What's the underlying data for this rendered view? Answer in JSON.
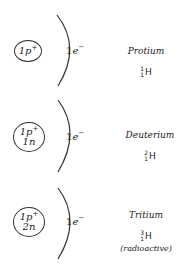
{
  "isotopes": [
    {
      "name": "Protium",
      "nucleus": {
        "protons": "1p",
        "proton_charge": "+",
        "neutrons": ""
      },
      "electron": {
        "count": "1",
        "symbol": "e",
        "charge": "−"
      },
      "notation": {
        "mass": "1",
        "atomic": "1",
        "element": "H"
      },
      "note": ""
    },
    {
      "name": "Deuterium",
      "nucleus": {
        "protons": "1p",
        "proton_charge": "+",
        "neutrons": "1n"
      },
      "electron": {
        "count": "1",
        "symbol": "e",
        "charge": "−"
      },
      "notation": {
        "mass": "2",
        "atomic": "1",
        "element": "H"
      },
      "note": ""
    },
    {
      "name": "Tritium",
      "nucleus": {
        "protons": "1p",
        "proton_charge": "+",
        "neutrons": "2n"
      },
      "electron": {
        "count": "1",
        "symbol": "e",
        "charge": "−"
      },
      "notation": {
        "mass": "3",
        "atomic": "1",
        "element": "H"
      },
      "note": "(radioactive)"
    }
  ]
}
